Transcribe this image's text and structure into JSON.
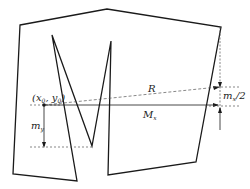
{
  "diagram": {
    "colors": {
      "stroke": "#1a1a1a",
      "dashed": "#555555",
      "background": "#ffffff"
    },
    "labels": {
      "point": "(x",
      "point_x_sub": "0",
      "point_mid": ", y",
      "point_y_sub": "0",
      "point_close": ")",
      "R": "R",
      "Mx": "M",
      "Mx_sub": "x",
      "my": "m",
      "my_sub": "y",
      "mx_half": "m",
      "mx_half_sub": "x",
      "mx_half_suffix": "/2"
    }
  }
}
